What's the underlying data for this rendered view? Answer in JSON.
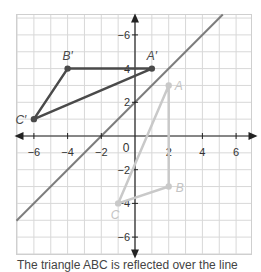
{
  "diagram": {
    "colors": {
      "grid": "#d8d8d8",
      "frame": "#cfcfcf",
      "axis": "#222222",
      "mirror_line": "#7d7d7d",
      "image_triangle": "#4a4a4a",
      "preimage_triangle": "#c9c9c9",
      "preimage_label": "#c4c4c4",
      "axis_label": "#333333"
    },
    "x_range": [
      -7,
      7
    ],
    "y_range": [
      -7,
      7.2
    ],
    "x_tick_labels": [
      {
        "value": -6,
        "label": "−6"
      },
      {
        "value": -4,
        "label": "−4"
      },
      {
        "value": -2,
        "label": "−2"
      },
      {
        "value": 2,
        "label": "2"
      },
      {
        "value": 4,
        "label": "4"
      },
      {
        "value": 6,
        "label": "6"
      }
    ],
    "y_tick_labels": [
      {
        "value": 6,
        "label": "−6"
      },
      {
        "value": 4,
        "label": "4"
      },
      {
        "value": 2,
        "label": "2"
      },
      {
        "value": -2,
        "label": "−2"
      },
      {
        "value": -4,
        "label": "−4"
      },
      {
        "value": -6,
        "label": "−6"
      }
    ],
    "origin_label": "0",
    "mirror_line": {
      "equation": "y = x + 2",
      "slope": 1,
      "intercept": 2
    },
    "preimage": {
      "name": "ABC",
      "points": [
        {
          "label": "A",
          "x": 2,
          "y": 3
        },
        {
          "label": "B",
          "x": 2,
          "y": -3
        },
        {
          "label": "C",
          "x": -1,
          "y": -4
        }
      ]
    },
    "image": {
      "name": "A′B′C′",
      "points": [
        {
          "label": "A′",
          "x": 1,
          "y": 4
        },
        {
          "label": "B′",
          "x": -4,
          "y": 4
        },
        {
          "label": "C′",
          "x": -6,
          "y": 1
        }
      ]
    }
  },
  "caption": "The triangle ABC is reflected over the line"
}
